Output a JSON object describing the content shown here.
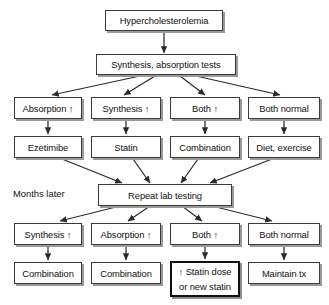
{
  "diagram": {
    "stage_labels": [
      {
        "id": "months-later",
        "text": "Months later"
      }
    ],
    "nodes": [
      {
        "id": "hypercholesterolemia",
        "text": "Hypercholesterolemia",
        "emphasis": false
      },
      {
        "id": "synthesis-absorption-tests",
        "text": "Synthesis, absorption tests",
        "emphasis": false
      },
      {
        "id": "r1-absorption-up",
        "text": "Absorption ↑",
        "emphasis": false
      },
      {
        "id": "r1-synthesis-up",
        "text": "Synthesis ↑",
        "emphasis": false
      },
      {
        "id": "r1-both-up",
        "text": "Both ↑",
        "emphasis": false
      },
      {
        "id": "r1-both-normal",
        "text": "Both normal",
        "emphasis": false
      },
      {
        "id": "tx-ezetimibe",
        "text": "Ezetimibe",
        "emphasis": false
      },
      {
        "id": "tx-statin",
        "text": "Statin",
        "emphasis": false
      },
      {
        "id": "tx-combination",
        "text": "Combination",
        "emphasis": false
      },
      {
        "id": "tx-diet-exercise",
        "text": "Diet, exercise",
        "emphasis": false
      },
      {
        "id": "repeat-lab-testing",
        "text": "Repeat lab testing",
        "emphasis": false
      },
      {
        "id": "r2-synthesis-up",
        "text": "Synthesis ↑",
        "emphasis": false
      },
      {
        "id": "r2-absorption-up",
        "text": "Absorption ↑",
        "emphasis": false
      },
      {
        "id": "r2-both-up",
        "text": "Both ↑",
        "emphasis": false
      },
      {
        "id": "r2-both-normal",
        "text": "Both normal",
        "emphasis": false
      },
      {
        "id": "final-combination-left",
        "text": "Combination",
        "emphasis": false
      },
      {
        "id": "final-combination-mid",
        "text": "Combination",
        "emphasis": false
      },
      {
        "id": "final-statin-dose",
        "text": "↑ Statin dose\nor new statin",
        "emphasis": true
      },
      {
        "id": "final-maintain-tx",
        "text": "Maintain tx",
        "emphasis": false
      }
    ],
    "colors": {
      "background": "#ffffff",
      "box_border": "#3a3a3a",
      "box_shadow": "#9a9a9a",
      "text": "#111111",
      "connector": "#2b2b2b",
      "emphasis_border": "#111111"
    }
  }
}
